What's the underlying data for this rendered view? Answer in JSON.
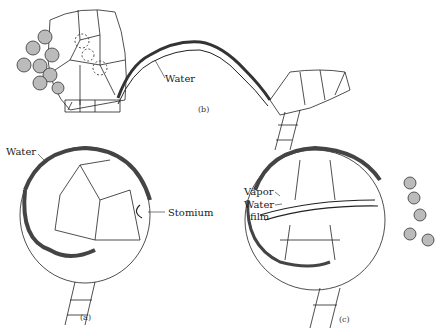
{
  "figure": {
    "panels": [
      {
        "id": "a",
        "caption": "(a)",
        "labels": {
          "water": "Water",
          "stomium": "Stomium"
        }
      },
      {
        "id": "b",
        "caption": "(b)",
        "labels": {
          "water": "Water"
        }
      },
      {
        "id": "c",
        "caption": "(c)",
        "labels": {
          "vapor": "Vapor",
          "water_film_line1": "Water",
          "water_film_line2": "film"
        }
      }
    ]
  }
}
